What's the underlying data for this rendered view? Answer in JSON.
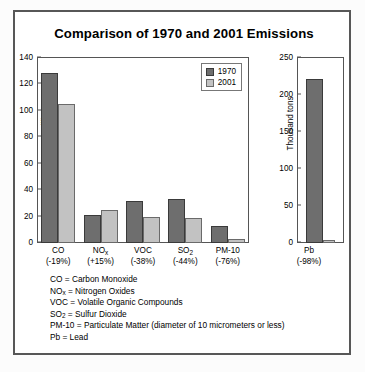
{
  "title": "Comparison of 1970 and 2001 Emissions",
  "legend": {
    "items": [
      {
        "label": "1970",
        "color": "#6e6e6e"
      },
      {
        "label": "2001",
        "color": "#c2c2c2"
      }
    ]
  },
  "notes": [
    {
      "term": "CO",
      "sub": "",
      "definition": " = Carbon Monoxide"
    },
    {
      "term": "NO",
      "sub": "x",
      "definition": " = Nitrogen Oxides"
    },
    {
      "term": "VOC",
      "sub": "",
      "definition": " = Volatile Organic Compounds"
    },
    {
      "term": "SO",
      "sub": "2",
      "definition": " = Sulfur Dioxide"
    },
    {
      "term": "PM-10",
      "sub": "",
      "definition": " = Particulate Matter (diameter of 10 micrometers or less)"
    },
    {
      "term": "Pb",
      "sub": "",
      "definition": " = Lead"
    }
  ],
  "chart_data": [
    {
      "type": "bar",
      "title": "Comparison of 1970 and 2001 Emissions",
      "xlabel": "",
      "ylabel": "Million tons",
      "ylim": [
        0,
        140
      ],
      "yticks": [
        0,
        20,
        40,
        60,
        80,
        100,
        120,
        140
      ],
      "grid": false,
      "legend_position": "top-right",
      "categories": [
        "CO",
        "NOx",
        "VOC",
        "SO2",
        "PM-10"
      ],
      "category_labels": [
        {
          "name": "CO",
          "sub": "",
          "change": "(-19%)"
        },
        {
          "name": "NO",
          "sub": "x",
          "change": "(+15%)"
        },
        {
          "name": "VOC",
          "sub": "",
          "change": "(-38%)"
        },
        {
          "name": "SO",
          "sub": "2",
          "change": "(-44%)"
        },
        {
          "name": "PM-10",
          "sub": "",
          "change": "(-76%)"
        }
      ],
      "series": [
        {
          "name": "1970",
          "values": [
            129,
            21,
            32,
            33,
            13
          ]
        },
        {
          "name": "2001",
          "values": [
            105,
            25,
            20,
            19,
            3
          ]
        }
      ]
    },
    {
      "type": "bar",
      "title": "",
      "xlabel": "",
      "ylabel": "Thousand tons",
      "ylim": [
        0,
        250
      ],
      "yticks": [
        0,
        50,
        100,
        150,
        200,
        250
      ],
      "grid": false,
      "categories": [
        "Pb"
      ],
      "category_labels": [
        {
          "name": "Pb",
          "sub": "",
          "change": "(-98%)"
        }
      ],
      "series": [
        {
          "name": "1970",
          "values": [
            221
          ]
        },
        {
          "name": "2001",
          "values": [
            4
          ]
        }
      ]
    }
  ]
}
